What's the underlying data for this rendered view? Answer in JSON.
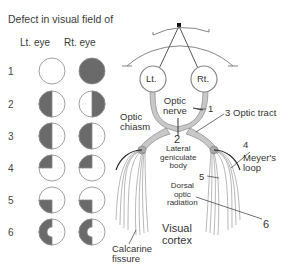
{
  "header": {
    "title": "Defect in visual field of",
    "col_left": "Lt. eye",
    "col_right": "Rt. eye"
  },
  "rows": [
    {
      "num": "1",
      "left": "normal",
      "right": "complete-blind"
    },
    {
      "num": "2",
      "left": "temporal-hemianopia",
      "right": "temporal-hemianopia"
    },
    {
      "num": "3",
      "left": "left-homonymous-hemianopia",
      "right": "left-homonymous-hemianopia"
    },
    {
      "num": "4",
      "left": "upper-left-quadrantanopia",
      "right": "upper-left-quadrantanopia"
    },
    {
      "num": "5",
      "left": "lower-left-quadrantanopia",
      "right": "lower-left-quadrantanopia"
    },
    {
      "num": "6",
      "left": "left-hemianopia-macular-sparing",
      "right": "left-hemianopia-macular-sparing"
    }
  ],
  "anatomy": {
    "eye_left": "Lt.",
    "eye_right": "Rt.",
    "optic_nerve": "Optic\nnerve",
    "optic_chiasm": "Optic\nchiasm",
    "optic_tract": "Optic tract",
    "lgb": "Lateral\ngeniculate\nbody",
    "meyers_loop": "Meyer's\nloop",
    "dorsal_radiation": "Dorsal\noptic\nradiation",
    "visual_cortex": "Visual\ncortex",
    "calcarine": "Calcarine\nfissure",
    "markers": {
      "m1": "1",
      "m2": "2",
      "m3": "3",
      "m4": "4",
      "m5": "5",
      "m6": "6"
    }
  },
  "colors": {
    "defect_fill": "#6a6a6a",
    "pathway_fill": "#c8c8c8",
    "line": "#555555"
  }
}
